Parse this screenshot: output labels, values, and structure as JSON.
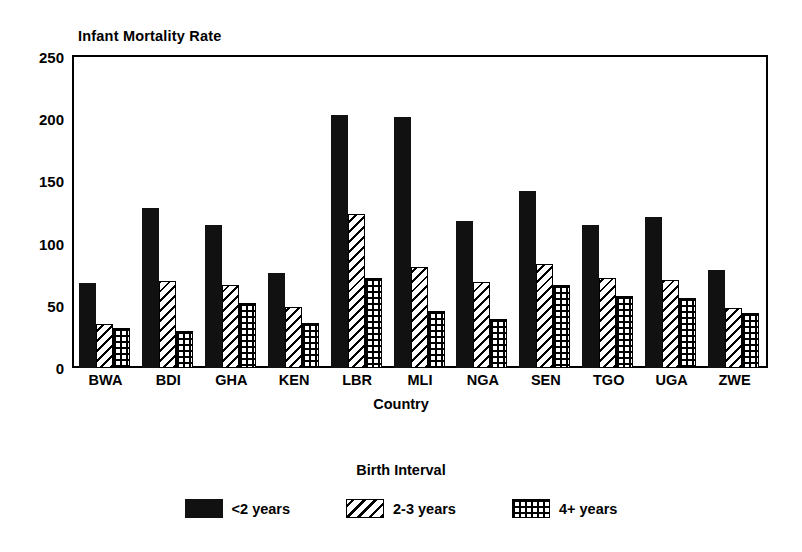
{
  "chart_data": {
    "type": "bar",
    "title": "Infant Mortality Rate",
    "xlabel": "Country",
    "ylabel": "Infant Mortality Rate",
    "ylim": [
      0,
      250
    ],
    "yticks": [
      0,
      50,
      100,
      150,
      200,
      250
    ],
    "grid": false,
    "legend_position": "bottom",
    "legend_title": "Birth Interval",
    "categories": [
      "BWA",
      "BDI",
      "GHA",
      "KEN",
      "LBR",
      "MLI",
      "NGA",
      "SEN",
      "TGO",
      "UGA",
      "ZWE"
    ],
    "series": [
      {
        "name": "<2 years",
        "pattern": "solid",
        "values": [
          68,
          129,
          115,
          76,
          203,
          202,
          118,
          142,
          115,
          121,
          79
        ]
      },
      {
        "name": "2-3 years",
        "pattern": "diagonal-hatch",
        "values": [
          35,
          70,
          67,
          49,
          124,
          81,
          69,
          84,
          72,
          71,
          48
        ]
      },
      {
        "name": "4+ years",
        "pattern": "cross-grid",
        "values": [
          32,
          30,
          52,
          36,
          72,
          46,
          39,
          67,
          58,
          56,
          44
        ]
      }
    ]
  },
  "axis": {
    "y_tick_labels": [
      "250",
      "200",
      "150",
      "100",
      "50",
      "0"
    ],
    "x_tick_labels": [
      "BWA",
      "BDI",
      "GHA",
      "KEN",
      "LBR",
      "MLI",
      "NGA",
      "SEN",
      "TGO",
      "UGA",
      "ZWE"
    ]
  },
  "legend": {
    "title": "Birth Interval",
    "items": [
      {
        "label": "<2 years",
        "swatch": "solid-black-swatch"
      },
      {
        "label": "2-3 years",
        "swatch": "diagonal-hatch-swatch"
      },
      {
        "label": "4+ years",
        "swatch": "cross-grid-swatch"
      }
    ]
  },
  "colors": {
    "foreground": "#000000",
    "background": "#ffffff",
    "bar_solid": "#111111"
  }
}
